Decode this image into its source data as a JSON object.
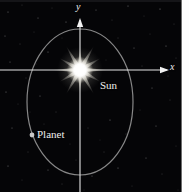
{
  "figure": {
    "width": 189,
    "height": 192,
    "background_color": "#050507",
    "border_color": "#6d6d6d",
    "margin_color": "#fdfdfd"
  },
  "axes": {
    "x_axis": {
      "label": "x",
      "color": "#e8e8e8",
      "y_position": 70,
      "x_start": 0,
      "x_end": 167,
      "arrow": "right"
    },
    "y_axis": {
      "label": "y",
      "color": "#e8e8e8",
      "x_position": 80,
      "y_start": 192,
      "y_end": 20,
      "arrow": "up"
    },
    "origin": {
      "x": 80,
      "y": 70
    }
  },
  "objects": {
    "sun": {
      "label": "Sun",
      "color": "#ffffff",
      "glow_color": "#fff8e8",
      "center": {
        "x": 80,
        "y": 70
      },
      "ray_count": 12,
      "ray_length": 28,
      "core_radius": 7
    },
    "planet": {
      "label": "Planet",
      "color": "#c8c8c8",
      "center": {
        "x": 32,
        "y": 135
      },
      "radius": 2.4
    },
    "orbit": {
      "name": "elliptical-orbit",
      "color": "#9a9a9a",
      "stroke_width": 1.2,
      "center": {
        "x": 80,
        "y": 102
      },
      "rx": 53,
      "ry": 73
    }
  },
  "stars": [
    {
      "x": 8,
      "y": 12,
      "r": 0.5,
      "o": 0.5
    },
    {
      "x": 22,
      "y": 5,
      "r": 0.4,
      "o": 0.4
    },
    {
      "x": 38,
      "y": 18,
      "r": 0.5,
      "o": 0.45
    },
    {
      "x": 52,
      "y": 8,
      "r": 0.4,
      "o": 0.35
    },
    {
      "x": 66,
      "y": 22,
      "r": 0.5,
      "o": 0.5
    },
    {
      "x": 96,
      "y": 10,
      "r": 0.5,
      "o": 0.45
    },
    {
      "x": 112,
      "y": 20,
      "r": 0.4,
      "o": 0.4
    },
    {
      "x": 128,
      "y": 6,
      "r": 0.5,
      "o": 0.5
    },
    {
      "x": 144,
      "y": 16,
      "r": 0.4,
      "o": 0.35
    },
    {
      "x": 160,
      "y": 9,
      "r": 0.5,
      "o": 0.55
    },
    {
      "x": 174,
      "y": 24,
      "r": 0.4,
      "o": 0.4
    },
    {
      "x": 5,
      "y": 36,
      "r": 0.5,
      "o": 0.45
    },
    {
      "x": 20,
      "y": 44,
      "r": 0.45,
      "o": 0.4
    },
    {
      "x": 34,
      "y": 32,
      "r": 0.4,
      "o": 0.35
    },
    {
      "x": 48,
      "y": 52,
      "r": 0.5,
      "o": 0.5
    },
    {
      "x": 118,
      "y": 38,
      "r": 0.45,
      "o": 0.4
    },
    {
      "x": 134,
      "y": 48,
      "r": 0.5,
      "o": 0.45
    },
    {
      "x": 150,
      "y": 34,
      "r": 0.4,
      "o": 0.35
    },
    {
      "x": 166,
      "y": 46,
      "r": 0.5,
      "o": 0.5
    },
    {
      "x": 176,
      "y": 58,
      "r": 0.4,
      "o": 0.4
    },
    {
      "x": 10,
      "y": 62,
      "r": 0.5,
      "o": 0.45
    },
    {
      "x": 26,
      "y": 78,
      "r": 0.45,
      "o": 0.4
    },
    {
      "x": 6,
      "y": 92,
      "r": 0.5,
      "o": 0.5
    },
    {
      "x": 18,
      "y": 104,
      "r": 0.4,
      "o": 0.35
    },
    {
      "x": 40,
      "y": 96,
      "r": 0.5,
      "o": 0.45
    },
    {
      "x": 56,
      "y": 112,
      "r": 0.45,
      "o": 0.4
    },
    {
      "x": 44,
      "y": 124,
      "r": 0.4,
      "o": 0.35
    },
    {
      "x": 12,
      "y": 128,
      "r": 0.5,
      "o": 0.45
    },
    {
      "x": 28,
      "y": 152,
      "r": 0.45,
      "o": 0.4
    },
    {
      "x": 8,
      "y": 166,
      "r": 0.5,
      "o": 0.5
    },
    {
      "x": 22,
      "y": 180,
      "r": 0.4,
      "o": 0.35
    },
    {
      "x": 48,
      "y": 170,
      "r": 0.5,
      "o": 0.45
    },
    {
      "x": 62,
      "y": 184,
      "r": 0.45,
      "o": 0.4
    },
    {
      "x": 76,
      "y": 160,
      "r": 0.4,
      "o": 0.35
    },
    {
      "x": 92,
      "y": 176,
      "r": 0.5,
      "o": 0.45
    },
    {
      "x": 104,
      "y": 152,
      "r": 0.45,
      "o": 0.4
    },
    {
      "x": 118,
      "y": 168,
      "r": 0.5,
      "o": 0.5
    },
    {
      "x": 132,
      "y": 186,
      "r": 0.4,
      "o": 0.35
    },
    {
      "x": 146,
      "y": 158,
      "r": 0.5,
      "o": 0.45
    },
    {
      "x": 162,
      "y": 174,
      "r": 0.45,
      "o": 0.4
    },
    {
      "x": 176,
      "y": 146,
      "r": 0.4,
      "o": 0.35
    },
    {
      "x": 110,
      "y": 120,
      "r": 0.5,
      "o": 0.5
    },
    {
      "x": 126,
      "y": 134,
      "r": 0.45,
      "o": 0.4
    },
    {
      "x": 140,
      "y": 110,
      "r": 0.4,
      "o": 0.35
    },
    {
      "x": 156,
      "y": 126,
      "r": 0.5,
      "o": 0.45
    },
    {
      "x": 170,
      "y": 100,
      "r": 0.45,
      "o": 0.4
    },
    {
      "x": 100,
      "y": 140,
      "r": 0.4,
      "o": 0.3
    },
    {
      "x": 88,
      "y": 128,
      "r": 0.45,
      "o": 0.35
    },
    {
      "x": 70,
      "y": 144,
      "r": 0.4,
      "o": 0.3
    },
    {
      "x": 152,
      "y": 88,
      "r": 0.5,
      "o": 0.45
    },
    {
      "x": 168,
      "y": 76,
      "r": 0.4,
      "o": 0.35
    },
    {
      "x": 36,
      "y": 64,
      "r": 0.4,
      "o": 0.3
    },
    {
      "x": 62,
      "y": 38,
      "r": 0.4,
      "o": 0.3
    },
    {
      "x": 106,
      "y": 60,
      "r": 0.4,
      "o": 0.3
    },
    {
      "x": 142,
      "y": 66,
      "r": 0.45,
      "o": 0.4
    },
    {
      "x": 30,
      "y": 112,
      "r": 0.4,
      "o": 0.3
    },
    {
      "x": 84,
      "y": 190,
      "r": 0.4,
      "o": 0.3
    },
    {
      "x": 178,
      "y": 190,
      "r": 0.4,
      "o": 0.3
    }
  ]
}
